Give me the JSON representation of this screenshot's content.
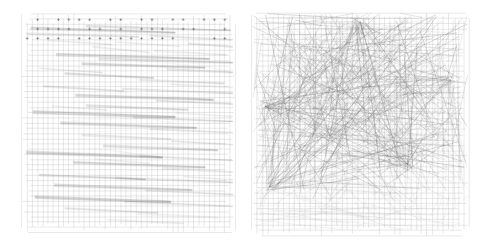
{
  "figure": {
    "title": "",
    "background_color": "#ffffff",
    "panel_count": 2,
    "layout": "side-by-side"
  },
  "panels": [
    {
      "id": "left-panel",
      "name": "orthogonal-grid-layout",
      "label": "",
      "x": 22,
      "y": 14,
      "width": 213,
      "height": 219,
      "grid": {
        "visible": true,
        "cell_size": 5.2,
        "columns": 41,
        "rows": 42,
        "color": "#b9b9b9",
        "line_width": 0.45
      },
      "edge_style": "near-horizontal bundled",
      "edge_color": "#6e6e6e",
      "node_color": "#555555",
      "node_marker": "plus",
      "density": "low"
    },
    {
      "id": "right-panel",
      "name": "force-directed-layout",
      "label": "",
      "x": 252,
      "y": 13,
      "width": 216,
      "height": 223,
      "grid": {
        "visible": true,
        "cell_size": 5.3,
        "columns": 41,
        "rows": 42,
        "color": "#b9b9b9",
        "line_width": 0.45
      },
      "edge_style": "straight random chords",
      "edge_color": "#707070",
      "node_color": "#555555",
      "node_marker": "none",
      "density": "high"
    }
  ],
  "chart_data": {
    "type": "scatter",
    "title": "",
    "subtitle": "",
    "xlabel": "",
    "ylabel": "",
    "grid": true,
    "legend": "none",
    "series": [
      {
        "name": "Left layout edges",
        "panel": "left-panel",
        "edge_count": 46,
        "description": "Long near-horizontal edge bundles spanning the grid with slight downward slope",
        "values": [
          {
            "x1": 0.04,
            "y1": 0.065,
            "x2": 0.72,
            "y2": 0.085,
            "w": 1.5,
            "a": 0.55
          },
          {
            "x1": 0.3,
            "y1": 0.055,
            "x2": 0.98,
            "y2": 0.075,
            "w": 1.2,
            "a": 0.45
          },
          {
            "x1": 0.02,
            "y1": 0.09,
            "x2": 0.55,
            "y2": 0.105,
            "w": 1.0,
            "a": 0.4
          },
          {
            "x1": 0.6,
            "y1": 0.1,
            "x2": 0.99,
            "y2": 0.118,
            "w": 0.9,
            "a": 0.35
          },
          {
            "x1": 0.78,
            "y1": 0.135,
            "x2": 0.99,
            "y2": 0.15,
            "w": 1.0,
            "a": 0.4
          },
          {
            "x1": 0.33,
            "y1": 0.15,
            "x2": 0.6,
            "y2": 0.175,
            "w": 0.8,
            "a": 0.3
          },
          {
            "x1": 0.16,
            "y1": 0.185,
            "x2": 0.88,
            "y2": 0.205,
            "w": 1.6,
            "a": 0.55
          },
          {
            "x1": 0.36,
            "y1": 0.205,
            "x2": 0.99,
            "y2": 0.222,
            "w": 1.2,
            "a": 0.45
          },
          {
            "x1": 0.28,
            "y1": 0.228,
            "x2": 0.86,
            "y2": 0.245,
            "w": 1.4,
            "a": 0.5
          },
          {
            "x1": 0.68,
            "y1": 0.252,
            "x2": 0.99,
            "y2": 0.268,
            "w": 1.0,
            "a": 0.38
          },
          {
            "x1": 0.2,
            "y1": 0.272,
            "x2": 0.62,
            "y2": 0.292,
            "w": 1.3,
            "a": 0.48
          },
          {
            "x1": 0.55,
            "y1": 0.3,
            "x2": 0.95,
            "y2": 0.318,
            "w": 0.9,
            "a": 0.33
          },
          {
            "x1": 0.1,
            "y1": 0.33,
            "x2": 0.48,
            "y2": 0.352,
            "w": 1.1,
            "a": 0.42
          },
          {
            "x1": 0.47,
            "y1": 0.342,
            "x2": 0.99,
            "y2": 0.362,
            "w": 1.0,
            "a": 0.38
          },
          {
            "x1": 0.25,
            "y1": 0.372,
            "x2": 0.9,
            "y2": 0.392,
            "w": 1.6,
            "a": 0.55
          },
          {
            "x1": 0.63,
            "y1": 0.395,
            "x2": 0.99,
            "y2": 0.412,
            "w": 0.9,
            "a": 0.33
          },
          {
            "x1": 0.3,
            "y1": 0.418,
            "x2": 0.78,
            "y2": 0.438,
            "w": 1.2,
            "a": 0.45
          },
          {
            "x1": 0.05,
            "y1": 0.448,
            "x2": 0.72,
            "y2": 0.47,
            "w": 1.7,
            "a": 0.58
          },
          {
            "x1": 0.52,
            "y1": 0.472,
            "x2": 0.99,
            "y2": 0.49,
            "w": 1.0,
            "a": 0.38
          },
          {
            "x1": 0.18,
            "y1": 0.498,
            "x2": 0.82,
            "y2": 0.52,
            "w": 1.5,
            "a": 0.52
          },
          {
            "x1": 0.6,
            "y1": 0.525,
            "x2": 0.99,
            "y2": 0.542,
            "w": 0.9,
            "a": 0.33
          },
          {
            "x1": 0.28,
            "y1": 0.552,
            "x2": 0.7,
            "y2": 0.572,
            "w": 1.1,
            "a": 0.4
          },
          {
            "x1": 0.7,
            "y1": 0.58,
            "x2": 0.99,
            "y2": 0.596,
            "w": 0.9,
            "a": 0.32
          },
          {
            "x1": 0.38,
            "y1": 0.602,
            "x2": 0.92,
            "y2": 0.622,
            "w": 1.3,
            "a": 0.47
          },
          {
            "x1": 0.02,
            "y1": 0.632,
            "x2": 0.66,
            "y2": 0.655,
            "w": 1.8,
            "a": 0.6
          },
          {
            "x1": 0.55,
            "y1": 0.648,
            "x2": 0.99,
            "y2": 0.668,
            "w": 1.0,
            "a": 0.36
          },
          {
            "x1": 0.24,
            "y1": 0.678,
            "x2": 0.86,
            "y2": 0.7,
            "w": 1.4,
            "a": 0.5
          },
          {
            "x1": 0.66,
            "y1": 0.705,
            "x2": 0.99,
            "y2": 0.722,
            "w": 0.9,
            "a": 0.32
          },
          {
            "x1": 0.08,
            "y1": 0.735,
            "x2": 0.58,
            "y2": 0.756,
            "w": 1.2,
            "a": 0.44
          },
          {
            "x1": 0.44,
            "y1": 0.748,
            "x2": 0.99,
            "y2": 0.77,
            "w": 1.1,
            "a": 0.4
          },
          {
            "x1": 0.15,
            "y1": 0.782,
            "x2": 0.8,
            "y2": 0.804,
            "w": 1.6,
            "a": 0.55
          },
          {
            "x1": 0.58,
            "y1": 0.806,
            "x2": 0.99,
            "y2": 0.824,
            "w": 0.9,
            "a": 0.32
          },
          {
            "x1": 0.06,
            "y1": 0.836,
            "x2": 0.7,
            "y2": 0.858,
            "w": 1.7,
            "a": 0.58
          },
          {
            "x1": 0.48,
            "y1": 0.858,
            "x2": 0.99,
            "y2": 0.878,
            "w": 1.0,
            "a": 0.36
          },
          {
            "x1": 0.2,
            "y1": 0.888,
            "x2": 0.64,
            "y2": 0.908,
            "w": 1.0,
            "a": 0.35
          },
          {
            "x1": 0.54,
            "y1": 0.912,
            "x2": 0.92,
            "y2": 0.93,
            "w": 0.8,
            "a": 0.28
          },
          {
            "x1": 0.12,
            "y1": 0.12,
            "x2": 0.42,
            "y2": 0.14,
            "w": 0.8,
            "a": 0.28
          },
          {
            "x1": 0.44,
            "y1": 0.128,
            "x2": 0.74,
            "y2": 0.148,
            "w": 0.7,
            "a": 0.25
          },
          {
            "x1": 0.62,
            "y1": 0.168,
            "x2": 0.96,
            "y2": 0.186,
            "w": 0.8,
            "a": 0.28
          },
          {
            "x1": 0.08,
            "y1": 0.248,
            "x2": 0.38,
            "y2": 0.268,
            "w": 0.8,
            "a": 0.28
          },
          {
            "x1": 0.7,
            "y1": 0.32,
            "x2": 0.99,
            "y2": 0.336,
            "w": 0.7,
            "a": 0.25
          },
          {
            "x1": 0.14,
            "y1": 0.42,
            "x2": 0.4,
            "y2": 0.44,
            "w": 0.7,
            "a": 0.25
          },
          {
            "x1": 0.72,
            "y1": 0.452,
            "x2": 0.99,
            "y2": 0.468,
            "w": 0.7,
            "a": 0.25
          },
          {
            "x1": 0.34,
            "y1": 0.662,
            "x2": 0.6,
            "y2": 0.682,
            "w": 0.7,
            "a": 0.25
          },
          {
            "x1": 0.76,
            "y1": 0.742,
            "x2": 0.99,
            "y2": 0.758,
            "w": 0.7,
            "a": 0.25
          },
          {
            "x1": 0.4,
            "y1": 0.94,
            "x2": 0.76,
            "y2": 0.956,
            "w": 0.7,
            "a": 0.25
          }
        ]
      },
      {
        "name": "Right layout edges",
        "panel": "right-panel",
        "edge_count": 320,
        "description": "Dense tangled straight chords across all orientations, concentrated in the upper two thirds",
        "seed": 7,
        "hubs": [
          {
            "x": 0.06,
            "y": 0.42,
            "weight": 1.0
          },
          {
            "x": 0.08,
            "y": 0.78,
            "weight": 0.9
          },
          {
            "x": 0.5,
            "y": 0.04,
            "weight": 0.8
          },
          {
            "x": 0.92,
            "y": 0.3,
            "weight": 0.7
          },
          {
            "x": 0.36,
            "y": 0.55,
            "weight": 0.6
          },
          {
            "x": 0.72,
            "y": 0.68,
            "weight": 0.6
          }
        ]
      }
    ],
    "xlim": [
      0,
      1
    ],
    "ylim": [
      0,
      1
    ]
  },
  "colors": {
    "background": "#ffffff",
    "grid_line": "#b9b9b9",
    "edge": "#6e6e6e",
    "node": "#555555"
  }
}
